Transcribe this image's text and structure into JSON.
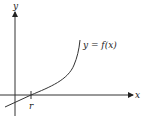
{
  "diagram": {
    "y_axis_label": "y",
    "x_axis_label": "x",
    "curve_label": "y = f(x)",
    "root_label": "r",
    "colors": {
      "stroke": "#333333",
      "background": "#ffffff"
    }
  }
}
